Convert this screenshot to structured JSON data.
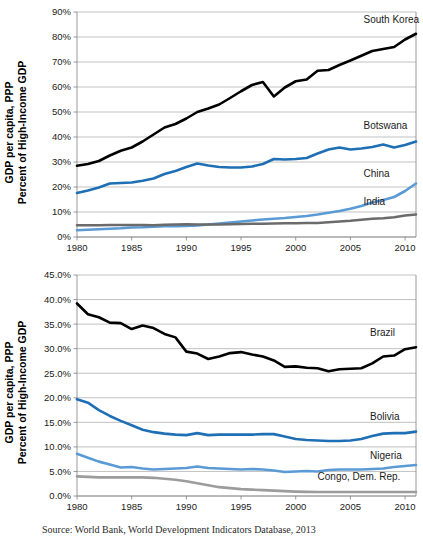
{
  "figure": {
    "source_note": "Source: World Bank, World Development Indicators Database, 2013"
  },
  "chart_data": [
    {
      "id": "top",
      "type": "line",
      "title": "",
      "xlabel": "",
      "ylabel": "GDP per capita, PPP\nPercent of High-Income GDP",
      "ylabel_line1": "GDP per capita, PPP",
      "ylabel_line2": "Percent of High-Income GDP",
      "grid": true,
      "legend_position": "inline-right",
      "xlim": [
        1980,
        2011
      ],
      "ylim": [
        0,
        90
      ],
      "xticks": [
        1980,
        1985,
        1990,
        1995,
        2000,
        2005,
        2010
      ],
      "xticklabels": [
        "1980",
        "1985",
        "1990",
        "1995",
        "2000",
        "2005",
        "2010"
      ],
      "yticks": [
        0,
        10,
        20,
        30,
        40,
        50,
        60,
        70,
        80,
        90
      ],
      "yticklabels": [
        "0%",
        "10%",
        "20%",
        "30%",
        "40%",
        "50%",
        "60%",
        "70%",
        "80%",
        "90%"
      ],
      "x": [
        1980,
        1981,
        1982,
        1983,
        1984,
        1985,
        1986,
        1987,
        1988,
        1989,
        1990,
        1991,
        1992,
        1993,
        1994,
        1995,
        1996,
        1997,
        1998,
        1999,
        2000,
        2001,
        2002,
        2003,
        2004,
        2005,
        2006,
        2007,
        2008,
        2009,
        2010,
        2011
      ],
      "series": [
        {
          "name": "South Korea",
          "color": "#000000",
          "label_x": 2006.2,
          "label_y": 85.5,
          "values": [
            28.5,
            29.2,
            30.4,
            32.6,
            34.5,
            35.8,
            38.2,
            41.0,
            43.8,
            45.2,
            47.4,
            50.0,
            51.4,
            53.0,
            55.6,
            58.3,
            60.8,
            62.0,
            56.2,
            59.8,
            62.3,
            63.0,
            66.5,
            66.8,
            68.8,
            70.6,
            72.5,
            74.4,
            75.2,
            76.0,
            79.0,
            81.3
          ]
        },
        {
          "name": "Botswana",
          "color": "#1F6FB5",
          "label_x": 2006.2,
          "label_y": 43.2,
          "values": [
            17.6,
            18.6,
            19.8,
            21.4,
            21.6,
            21.8,
            22.5,
            23.4,
            25.2,
            26.4,
            28.0,
            29.4,
            28.6,
            28.0,
            27.8,
            27.8,
            28.2,
            29.2,
            31.2,
            31.0,
            31.2,
            31.6,
            33.4,
            35.0,
            35.8,
            35.0,
            35.4,
            36.0,
            37.0,
            35.8,
            36.8,
            38.2
          ]
        },
        {
          "name": "China",
          "color": "#5B9BD5",
          "label_x": 2006.2,
          "label_y": 24.0,
          "values": [
            2.7,
            2.9,
            3.1,
            3.3,
            3.5,
            3.8,
            3.9,
            4.1,
            4.3,
            4.3,
            4.4,
            4.6,
            5.0,
            5.4,
            5.8,
            6.2,
            6.6,
            7.0,
            7.3,
            7.6,
            8.0,
            8.4,
            9.0,
            9.7,
            10.4,
            11.3,
            12.4,
            13.8,
            14.8,
            16.0,
            18.4,
            21.4
          ]
        },
        {
          "name": "India",
          "color": "#6B6B6B",
          "label_x": 2006.2,
          "label_y": 13.0,
          "values": [
            4.7,
            4.7,
            4.7,
            4.8,
            4.8,
            4.8,
            4.8,
            4.7,
            4.9,
            5.0,
            5.1,
            5.0,
            5.0,
            5.0,
            5.1,
            5.2,
            5.3,
            5.3,
            5.4,
            5.5,
            5.5,
            5.6,
            5.6,
            5.9,
            6.2,
            6.5,
            6.9,
            7.3,
            7.5,
            7.9,
            8.6,
            9.0
          ]
        }
      ]
    },
    {
      "id": "bottom",
      "type": "line",
      "title": "",
      "xlabel": "",
      "ylabel": "GDP per capita, PPP\nPercent of High-Income GDP",
      "ylabel_line1": "GDP per capita, PPP",
      "ylabel_line2": "Percent of High-Income GDP",
      "grid": true,
      "legend_position": "inline-right",
      "xlim": [
        1980,
        2011
      ],
      "ylim": [
        0.0,
        45.0
      ],
      "xticks": [
        1980,
        1985,
        1990,
        1995,
        2000,
        2005,
        2010
      ],
      "xticklabels": [
        "1980",
        "1985",
        "1990",
        "1995",
        "2000",
        "2005",
        "2010"
      ],
      "yticks": [
        0.0,
        5.0,
        10.0,
        15.0,
        20.0,
        25.0,
        30.0,
        35.0,
        40.0,
        45.0
      ],
      "yticklabels": [
        "0.0%",
        "5.0%",
        "10.0%",
        "15.0%",
        "20.0%",
        "25.0%",
        "30.0%",
        "35.0%",
        "40.0%",
        "45.0%"
      ],
      "x": [
        1980,
        1981,
        1982,
        1983,
        1984,
        1985,
        1986,
        1987,
        1988,
        1989,
        1990,
        1991,
        1992,
        1993,
        1994,
        1995,
        1996,
        1997,
        1998,
        1999,
        2000,
        2001,
        2002,
        2003,
        2004,
        2005,
        2006,
        2007,
        2008,
        2009,
        2010,
        2011
      ],
      "series": [
        {
          "name": "Brazil",
          "color": "#000000",
          "label_x": 2006.8,
          "label_y": 32.6,
          "values": [
            39.2,
            37.0,
            36.4,
            35.3,
            35.2,
            34.0,
            34.7,
            34.2,
            33.0,
            32.3,
            29.4,
            29.0,
            27.9,
            28.4,
            29.1,
            29.3,
            28.8,
            28.4,
            27.6,
            26.3,
            26.4,
            26.1,
            26.0,
            25.4,
            25.8,
            25.9,
            26.0,
            27.0,
            28.4,
            28.6,
            29.9,
            30.3
          ]
        },
        {
          "name": "Bolivia",
          "color": "#1F6FB5",
          "label_x": 2006.8,
          "label_y": 15.5,
          "values": [
            19.7,
            19.0,
            17.5,
            16.3,
            15.3,
            14.4,
            13.5,
            13.0,
            12.7,
            12.5,
            12.4,
            12.8,
            12.4,
            12.5,
            12.5,
            12.5,
            12.5,
            12.6,
            12.6,
            12.1,
            11.6,
            11.4,
            11.3,
            11.2,
            11.2,
            11.3,
            11.6,
            12.2,
            12.7,
            12.8,
            12.8,
            13.1
          ]
        },
        {
          "name": "Nigeria",
          "color": "#5B9BD5",
          "label_x": 2006.8,
          "label_y": 7.6,
          "values": [
            8.6,
            7.8,
            7.0,
            6.4,
            5.8,
            5.9,
            5.6,
            5.4,
            5.5,
            5.6,
            5.7,
            6.0,
            5.7,
            5.6,
            5.5,
            5.4,
            5.5,
            5.4,
            5.2,
            4.9,
            5.0,
            5.1,
            5.0,
            5.3,
            5.4,
            5.4,
            5.4,
            5.5,
            5.6,
            5.9,
            6.1,
            6.3
          ]
        },
        {
          "name": "Congo, Dem. Rep.",
          "color": "#9C9C9C",
          "label_x": 2002.0,
          "label_y": 3.3,
          "values": [
            4.0,
            3.9,
            3.8,
            3.8,
            3.8,
            3.8,
            3.8,
            3.7,
            3.5,
            3.3,
            3.0,
            2.6,
            2.2,
            1.8,
            1.6,
            1.4,
            1.3,
            1.2,
            1.1,
            1.0,
            0.9,
            0.85,
            0.8,
            0.8,
            0.8,
            0.8,
            0.8,
            0.8,
            0.8,
            0.8,
            0.8,
            0.8
          ]
        }
      ]
    }
  ]
}
